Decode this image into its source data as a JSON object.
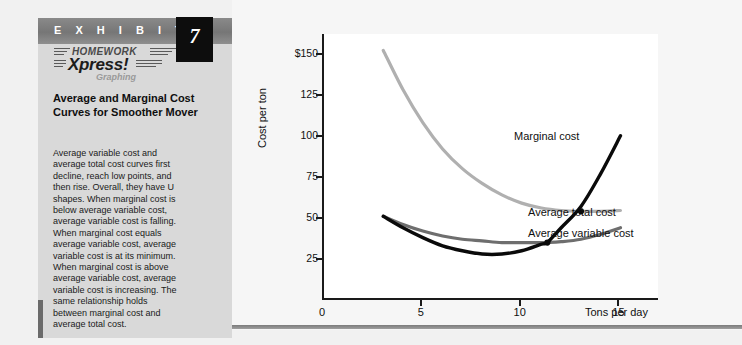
{
  "exhibit": {
    "word": "E X H I B I T",
    "number": "7",
    "logo": {
      "line1": "HOMEWORK",
      "line2": "Xpress!",
      "line3": "Graphing",
      "stripe_icon": "speed-stripes-icon"
    },
    "title": "Average and Marginal Cost Curves for Smoother Mover",
    "body": "Average variable cost and average total cost curves first decline, reach low points, and then rise. Overall, they have U shapes. When marginal cost is below average variable cost, average variable cost is falling. When marginal cost equals average variable cost, average variable cost is at its minimum. When marginal cost is above average variable cost, average variable cost is increasing. The same relationship holds between marginal cost and average total cost."
  },
  "colors": {
    "panel_bg": "#d9d9d9",
    "header_bar": "#7d7d7d",
    "number_box": "#0d0d0d",
    "marginal_cost": "#0a0a0a",
    "average_total_cost": "#b0b0b0",
    "average_variable_cost": "#6e6e6e",
    "axis": "#1a1a1a",
    "plot_bg": "#ffffff"
  },
  "chart_data": {
    "type": "line",
    "title": "",
    "xlabel": "Tons per day",
    "ylabel": "Cost per ton",
    "xlim": [
      0,
      17
    ],
    "ylim": [
      0,
      162
    ],
    "grid": false,
    "legend_position": "inline-right",
    "xticks": [
      "0",
      "5",
      "10",
      "15"
    ],
    "xtick_values": [
      0,
      5,
      10,
      15
    ],
    "yticks": [
      "25",
      "50",
      "75",
      "100",
      "125",
      "$150"
    ],
    "ytick_values": [
      25,
      50,
      75,
      100,
      125,
      150
    ],
    "series": [
      {
        "name": "Marginal cost",
        "color": "#0a0a0a",
        "x": [
          3,
          4,
          5,
          6,
          7,
          8,
          9,
          10,
          11,
          11.3,
          12,
          13,
          14,
          15
        ],
        "values": [
          51,
          44,
          38,
          33,
          30,
          28,
          28,
          30,
          34,
          35,
          44,
          57,
          77,
          100
        ]
      },
      {
        "name": "Average total cost",
        "color": "#b0b0b0",
        "x": [
          3,
          4,
          5,
          6,
          7,
          8,
          9,
          10,
          11,
          12,
          13,
          14,
          15
        ],
        "values": [
          152,
          128,
          108,
          92,
          80,
          71,
          64,
          59,
          56,
          54.5,
          54,
          54,
          54.5
        ]
      },
      {
        "name": "Average variable cost",
        "color": "#6e6e6e",
        "x": [
          3,
          4,
          5,
          6,
          7,
          8,
          9,
          10,
          11,
          11.3,
          12,
          13,
          14,
          15
        ],
        "values": [
          51,
          46,
          42,
          39,
          37,
          36,
          35,
          35,
          35,
          35,
          35.5,
          37,
          40,
          44
        ]
      }
    ],
    "annotations": [
      {
        "label": "Marginal cost",
        "series": "Marginal cost"
      },
      {
        "label": "Average total cost",
        "series": "Average total cost"
      },
      {
        "label": "Average variable cost",
        "series": "Average variable cost"
      }
    ],
    "intersections": [
      {
        "x": 11.3,
        "y": 35,
        "note": "MC crosses minimum AVC"
      },
      {
        "x": 13.0,
        "y": 54,
        "note": "MC crosses minimum ATC"
      }
    ]
  }
}
